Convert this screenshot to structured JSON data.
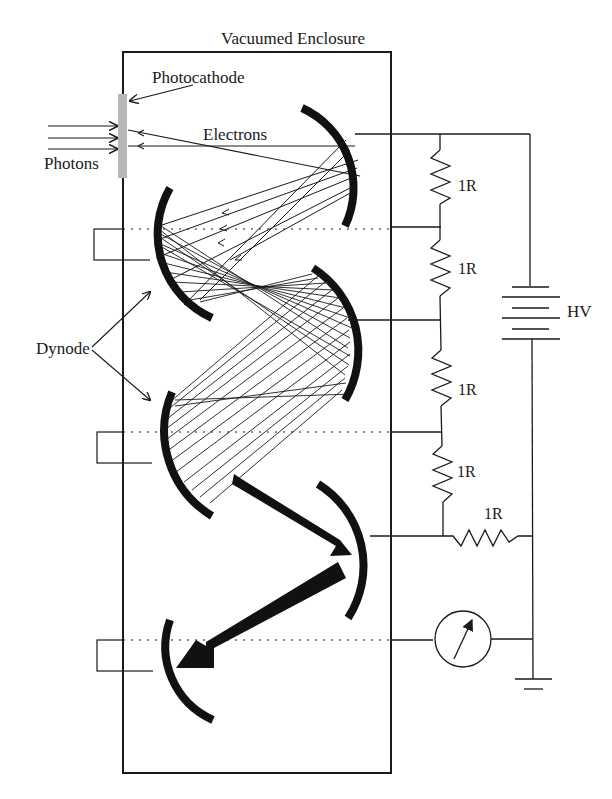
{
  "diagram": {
    "labels": {
      "enclosure": "Vacuumed Enclosure",
      "photocathode": "Photocathode",
      "electrons": "Electrons",
      "photons": "Photons",
      "dynode": "Dynode",
      "hv": "HV"
    },
    "resistors": [
      {
        "id": "r1",
        "label": "1R"
      },
      {
        "id": "r2",
        "label": "1R"
      },
      {
        "id": "r3",
        "label": "1R"
      },
      {
        "id": "r4",
        "label": "1R"
      },
      {
        "id": "r5",
        "label": "1R"
      }
    ],
    "components": {
      "battery": "high-voltage-battery",
      "meter": "ammeter",
      "ground": "ground"
    },
    "colors": {
      "ink": "#1a1a1a",
      "photocathode": "#b8b8b8",
      "background": "#ffffff"
    }
  }
}
